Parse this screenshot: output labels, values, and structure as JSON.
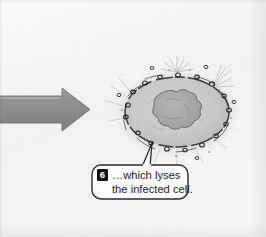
{
  "figure": {
    "type": "biology-illustration",
    "background_color": "#f4f4f2"
  },
  "arrow": {
    "name": "process-arrow",
    "direction": "right",
    "color": "#8e8e8e",
    "outline_color": "#6f6f6f"
  },
  "cell": {
    "name": "infected-cell",
    "fill_color": "#c9c9c7",
    "membrane_color": "#3a3a3a",
    "membrane_style": "dashed-broken",
    "nucleus_color": "#a9a9a6",
    "nucleus_outline": "#6d6d6a",
    "virus_particle_color": "#2e2e2e",
    "virus_particle_count": 22,
    "burst_color": "#b9b9b6"
  },
  "callout": {
    "name": "callout-6",
    "badge": "6",
    "badge_background": "#111111",
    "badge_text_color": "#ffffff",
    "border_color": "#2b2b2b",
    "background": "#fbfbfa",
    "lines": [
      "…which lyses",
      "the infected cell."
    ],
    "pointer": "up-left-to-cell"
  }
}
